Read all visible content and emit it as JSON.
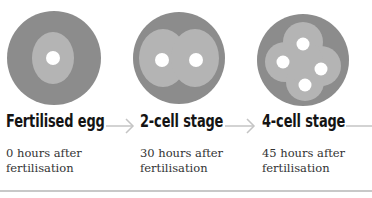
{
  "colors": {
    "outer": "#8c8c8c",
    "inner": "#b4b4b4",
    "nucleus": "#ffffff",
    "arrow": "#c4c4c4",
    "rule": "#c8c8c8"
  },
  "stages": [
    {
      "title": "Fertilised egg",
      "time_line1": "0 hours after",
      "time_line2": "fertilisation",
      "cells": 1
    },
    {
      "title": "2-cell stage",
      "time_line1": "30 hours after",
      "time_line2": "fertilisation",
      "cells": 2
    },
    {
      "title": "4-cell stage",
      "time_line1": "45 hours after",
      "time_line2": "fertilisation",
      "cells": 4
    }
  ],
  "arrows": [
    {
      "icon": "arrow-right-icon"
    },
    {
      "icon": "arrow-right-icon"
    },
    {
      "icon": "line-continuation-icon"
    }
  ]
}
